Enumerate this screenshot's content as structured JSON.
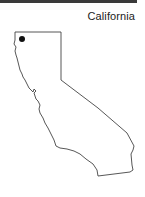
{
  "title": "California",
  "colors": {
    "outline": "#444444",
    "marker": "#111111",
    "top_bar": "#3a3a3a"
  },
  "marker": {
    "x": 22,
    "y": 39,
    "r": 3
  }
}
